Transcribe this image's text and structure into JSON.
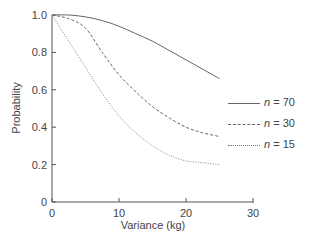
{
  "chart_data": {
    "type": "line",
    "title": "",
    "xlabel": "Variance (kg)",
    "ylabel": "Probability",
    "xlim": [
      0,
      30
    ],
    "ylim": [
      0,
      1.0
    ],
    "xticks": [
      0,
      10,
      20,
      30
    ],
    "yticks": [
      0,
      0.2,
      0.4,
      0.6,
      0.8,
      1.0
    ],
    "xtick_labels": [
      "0",
      "10",
      "20",
      "30"
    ],
    "ytick_labels": [
      "0",
      "0.2",
      "0.4",
      "0.6",
      "0.8",
      "1.0"
    ],
    "grid": false,
    "legend_position": "right",
    "x": [
      0,
      2.5,
      5,
      7.5,
      10,
      12.5,
      15,
      17.5,
      20,
      22.5,
      25
    ],
    "series": [
      {
        "name": "n = 70",
        "n": "70",
        "style": "solid",
        "values": [
          1.0,
          1.0,
          0.99,
          0.97,
          0.94,
          0.9,
          0.86,
          0.81,
          0.76,
          0.71,
          0.66
        ]
      },
      {
        "name": "n = 30",
        "n": "30",
        "style": "dashed",
        "values": [
          1.0,
          0.98,
          0.93,
          0.8,
          0.68,
          0.59,
          0.51,
          0.45,
          0.4,
          0.37,
          0.35
        ]
      },
      {
        "name": "n = 15",
        "n": "15",
        "style": "dotted",
        "values": [
          1.0,
          0.86,
          0.72,
          0.58,
          0.46,
          0.37,
          0.3,
          0.25,
          0.22,
          0.21,
          0.2
        ]
      }
    ]
  },
  "legend": {
    "prefix": "n",
    "items": [
      {
        "eq": " = 70"
      },
      {
        "eq": " = 30"
      },
      {
        "eq": " = 15"
      }
    ]
  }
}
